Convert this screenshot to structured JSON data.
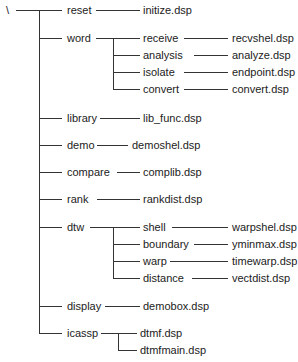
{
  "root": {
    "label": "\\",
    "x": 6,
    "y": 10
  },
  "nodes": [
    {
      "id": "reset",
      "label": "reset",
      "x": 67,
      "y": 10
    },
    {
      "id": "word",
      "label": "word",
      "x": 67,
      "y": 38
    },
    {
      "id": "library",
      "label": "library",
      "x": 67,
      "y": 118
    },
    {
      "id": "demo",
      "label": "demo",
      "x": 67,
      "y": 145
    },
    {
      "id": "compare",
      "label": "compare",
      "x": 67,
      "y": 172
    },
    {
      "id": "rank",
      "label": "rank",
      "x": 67,
      "y": 199
    },
    {
      "id": "dtw",
      "label": "dtw",
      "x": 67,
      "y": 227
    },
    {
      "id": "display",
      "label": "display",
      "x": 67,
      "y": 306
    },
    {
      "id": "icassp",
      "label": "icassp",
      "x": 67,
      "y": 333
    },
    {
      "id": "receive",
      "label": "receive",
      "x": 143,
      "y": 38
    },
    {
      "id": "analysis",
      "label": "analysis",
      "x": 143,
      "y": 55
    },
    {
      "id": "isolate",
      "label": "isolate",
      "x": 143,
      "y": 72
    },
    {
      "id": "convert",
      "label": "convert",
      "x": 143,
      "y": 89
    },
    {
      "id": "shell",
      "label": "shell",
      "x": 143,
      "y": 227
    },
    {
      "id": "boundary",
      "label": "boundary",
      "x": 143,
      "y": 244
    },
    {
      "id": "warp",
      "label": "warp",
      "x": 143,
      "y": 261
    },
    {
      "id": "distance",
      "label": "distance",
      "x": 143,
      "y": 278
    },
    {
      "id": "initize",
      "label": "initize.dsp",
      "x": 143,
      "y": 10
    },
    {
      "id": "lib_func",
      "label": "lib_func.dsp",
      "x": 143,
      "y": 118
    },
    {
      "id": "demoshel",
      "label": "demoshel.dsp",
      "x": 132,
      "y": 145
    },
    {
      "id": "complib",
      "label": "complib.dsp",
      "x": 143,
      "y": 172
    },
    {
      "id": "rankdist",
      "label": "rankdist.dsp",
      "x": 143,
      "y": 199
    },
    {
      "id": "demobox",
      "label": "demobox.dsp",
      "x": 143,
      "y": 306
    },
    {
      "id": "dtmf",
      "label": "dtmf.dsp",
      "x": 140,
      "y": 333
    },
    {
      "id": "dtmfmain",
      "label": "dtmfmain.dsp",
      "x": 140,
      "y": 350
    },
    {
      "id": "recvshel",
      "label": "recvshel.dsp",
      "x": 232,
      "y": 38
    },
    {
      "id": "analyze",
      "label": "analyze.dsp",
      "x": 232,
      "y": 55
    },
    {
      "id": "endpoint",
      "label": "endpoint.dsp",
      "x": 232,
      "y": 72
    },
    {
      "id": "convertdsp",
      "label": "convert.dsp",
      "x": 232,
      "y": 89
    },
    {
      "id": "warpshel",
      "label": "warpshel.dsp",
      "x": 232,
      "y": 227
    },
    {
      "id": "yminmax",
      "label": "yminmax.dsp",
      "x": 232,
      "y": 244
    },
    {
      "id": "timewarp",
      "label": "timewarp.dsp",
      "x": 232,
      "y": 261
    },
    {
      "id": "vectdist",
      "label": "vectdist.dsp",
      "x": 232,
      "y": 278
    }
  ],
  "lines": [
    [
      16,
      10,
      62,
      10
    ],
    [
      39,
      10,
      39,
      306
    ],
    [
      39,
      38,
      62,
      38
    ],
    [
      39,
      118,
      62,
      118
    ],
    [
      39,
      145,
      62,
      145
    ],
    [
      39,
      172,
      62,
      172
    ],
    [
      39,
      199,
      62,
      199
    ],
    [
      39,
      227,
      62,
      227
    ],
    [
      39,
      306,
      62,
      306
    ],
    [
      39,
      306,
      39,
      333
    ],
    [
      39,
      333,
      62,
      333
    ],
    [
      96,
      10,
      140,
      10
    ],
    [
      96,
      38,
      140,
      38
    ],
    [
      113,
      38,
      113,
      89
    ],
    [
      113,
      55,
      140,
      55
    ],
    [
      113,
      72,
      140,
      72
    ],
    [
      113,
      89,
      140,
      89
    ],
    [
      100,
      118,
      140,
      118
    ],
    [
      97,
      145,
      128,
      145
    ],
    [
      117,
      172,
      140,
      172
    ],
    [
      97,
      199,
      140,
      199
    ],
    [
      90,
      227,
      140,
      227
    ],
    [
      113,
      227,
      113,
      278
    ],
    [
      113,
      244,
      140,
      244
    ],
    [
      113,
      261,
      140,
      261
    ],
    [
      113,
      278,
      140,
      278
    ],
    [
      105,
      306,
      140,
      306
    ],
    [
      101,
      333,
      137,
      333
    ],
    [
      118,
      333,
      118,
      350
    ],
    [
      118,
      350,
      137,
      350
    ],
    [
      184,
      38,
      228,
      38
    ],
    [
      194,
      55,
      228,
      55
    ],
    [
      184,
      72,
      228,
      72
    ],
    [
      184,
      89,
      228,
      89
    ],
    [
      172,
      227,
      228,
      227
    ],
    [
      194,
      244,
      228,
      244
    ],
    [
      170,
      261,
      228,
      261
    ],
    [
      192,
      278,
      228,
      278
    ]
  ]
}
